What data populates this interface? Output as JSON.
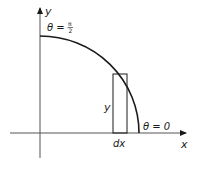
{
  "diagram": {
    "type": "quarter-circle-integration",
    "colors": {
      "ink": "#1a1a1a",
      "axis": "#555555",
      "background": "#ffffff"
    },
    "axes": {
      "x_label": "x",
      "y_label": "y"
    },
    "curve": {
      "description": "quarter circle arc in first quadrant",
      "start_label": "θ = 0",
      "end_label_prefix": "θ = ",
      "end_label_num": "π",
      "end_label_den": "2"
    },
    "strip": {
      "height_label": "y",
      "width_label": "dx"
    }
  }
}
